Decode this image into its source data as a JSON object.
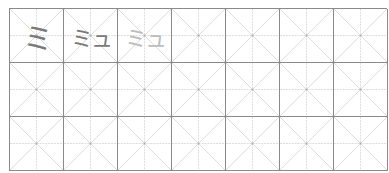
{
  "sheet": {
    "title": "Katakana practice grid",
    "columns": 7,
    "rows": 3,
    "colors": {
      "border": "#8a8a8a",
      "guide": "#d4d4d4",
      "trace_dark": "#7a7a7a",
      "trace_light": "#bdbdbd"
    },
    "cells": [
      {
        "text": "ミ",
        "style": "dark"
      },
      {
        "text": "ミュ",
        "style": "dark"
      },
      {
        "text": "ミュ",
        "style": "light"
      },
      {
        "text": "",
        "style": ""
      },
      {
        "text": "",
        "style": ""
      },
      {
        "text": "",
        "style": ""
      },
      {
        "text": "",
        "style": ""
      },
      {
        "text": "",
        "style": ""
      },
      {
        "text": "",
        "style": ""
      },
      {
        "text": "",
        "style": ""
      },
      {
        "text": "",
        "style": ""
      },
      {
        "text": "",
        "style": ""
      },
      {
        "text": "",
        "style": ""
      },
      {
        "text": "",
        "style": ""
      },
      {
        "text": "",
        "style": ""
      },
      {
        "text": "",
        "style": ""
      },
      {
        "text": "",
        "style": ""
      },
      {
        "text": "",
        "style": ""
      },
      {
        "text": "",
        "style": ""
      },
      {
        "text": "",
        "style": ""
      },
      {
        "text": "",
        "style": ""
      }
    ]
  }
}
